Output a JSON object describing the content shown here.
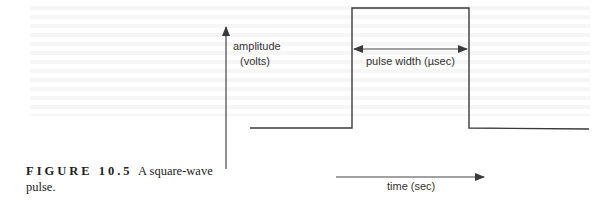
{
  "diagram": {
    "title": "Square-wave pulse",
    "y_axis_label_line1": "amplitude",
    "y_axis_label_line2": "(volts)",
    "pulse_width_label": "pulse width (µsec)",
    "time_axis_label": "time (sec)",
    "line_color": "#3a3a3a"
  },
  "caption": {
    "figure_number": "FIGURE 10.5",
    "text": "A square-wave pulse."
  }
}
